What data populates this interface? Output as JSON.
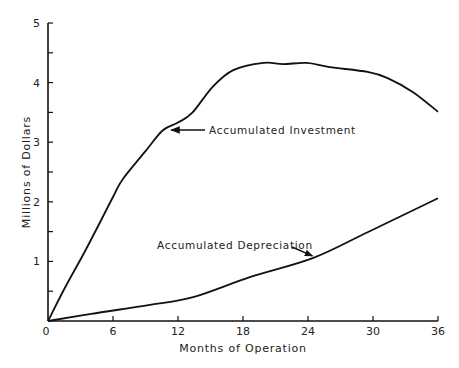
{
  "chart_data": {
    "type": "line",
    "title": "",
    "xlabel": "Months of Operation",
    "ylabel": "Millions of Dollars",
    "xlim": [
      0,
      36
    ],
    "ylim": [
      0,
      5
    ],
    "x_ticks": [
      0,
      6,
      12,
      18,
      24,
      30,
      36
    ],
    "y_ticks": [
      1,
      2,
      3,
      4,
      5
    ],
    "grid": false,
    "series": [
      {
        "name": "Accumulated Investment",
        "x": [
          0,
          1.6,
          3.5,
          6.0,
          6.9,
          9.0,
          10.6,
          12.0,
          13.3,
          15.2,
          17.1,
          19.9,
          21.7,
          23.9,
          26.0,
          29.5,
          31.3,
          33.7,
          36.0
        ],
        "values": [
          0,
          0.57,
          1.2,
          2.08,
          2.38,
          2.85,
          3.2,
          3.33,
          3.49,
          3.93,
          4.21,
          4.33,
          4.31,
          4.33,
          4.26,
          4.18,
          4.08,
          3.84,
          3.51
        ]
      },
      {
        "name": "Accumulated Depreciation",
        "x": [
          0,
          4,
          9.4,
          13.4,
          18.7,
          24.5,
          29.5,
          36.0
        ],
        "values": [
          0,
          0.12,
          0.27,
          0.4,
          0.74,
          1.06,
          1.49,
          2.06
        ]
      }
    ],
    "annotations": [
      {
        "text": "Accumulated Investment",
        "arrow_to": [
          11,
          3.2
        ]
      },
      {
        "text": "Accumulated Depreciation",
        "arrow_to": [
          24.5,
          1.06
        ]
      }
    ]
  }
}
